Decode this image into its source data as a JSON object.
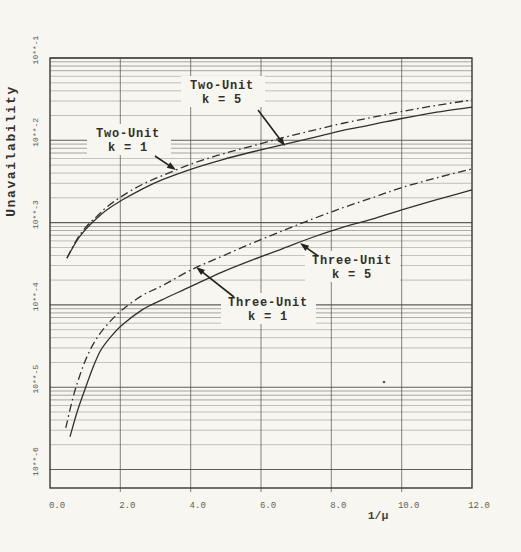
{
  "page": {
    "background": "#f7f6f1",
    "ink_color": "#34312b"
  },
  "chart_data": {
    "type": "line",
    "title": "",
    "xlabel": "1/μ",
    "ylabel": "Unavailability",
    "x_scale": "linear",
    "y_scale": "log",
    "xlim": [
      0,
      12
    ],
    "ylim": [
      1e-06,
      0.1
    ],
    "grid": "horizontal log minor lines each decade (2-9), vertical major lines every 2.0",
    "legend": "none (curves labeled on-plot with arrows)",
    "x_ticks": [
      {
        "label": "0.0",
        "value": 0
      },
      {
        "label": "2.0",
        "value": 2
      },
      {
        "label": "4.0",
        "value": 4
      },
      {
        "label": "6.0",
        "value": 6
      },
      {
        "label": "8.0",
        "value": 8
      },
      {
        "label": "10.0",
        "value": 10
      },
      {
        "label": "12.0",
        "value": 12
      }
    ],
    "y_ticks": [
      {
        "label": "10**-1",
        "value": 0.1
      },
      {
        "label": "10**-2",
        "value": 0.01
      },
      {
        "label": "10**-3",
        "value": 0.001
      },
      {
        "label": "10**-4",
        "value": 0.0001
      },
      {
        "label": "10**-5",
        "value": 1e-05
      },
      {
        "label": "10**-6",
        "value": 1e-06
      }
    ],
    "series": [
      {
        "name": "two-unit-k1",
        "label": "Two-Unit k = 1",
        "line_style": "dashdot",
        "points": [
          [
            0.48,
            0.00037
          ],
          [
            0.77,
            0.00063
          ],
          [
            1.05,
            0.00091
          ],
          [
            1.34,
            0.0012
          ],
          [
            1.62,
            0.00155
          ],
          [
            2.05,
            0.0021
          ],
          [
            2.62,
            0.0029
          ],
          [
            3.18,
            0.0037
          ],
          [
            4.04,
            0.0052
          ],
          [
            4.89,
            0.0068
          ],
          [
            5.74,
            0.0085
          ],
          [
            6.6,
            0.0107
          ],
          [
            7.45,
            0.0131
          ],
          [
            8.3,
            0.016
          ],
          [
            9.16,
            0.019
          ],
          [
            10.0,
            0.0224
          ],
          [
            11.0,
            0.0266
          ],
          [
            12.0,
            0.031
          ]
        ]
      },
      {
        "name": "two-unit-k5",
        "label": "Two-Unit k = 5",
        "line_style": "solid",
        "points": [
          [
            0.48,
            0.00037
          ],
          [
            0.77,
            0.00061
          ],
          [
            1.05,
            0.00086
          ],
          [
            1.34,
            0.00114
          ],
          [
            1.62,
            0.00143
          ],
          [
            2.05,
            0.00188
          ],
          [
            2.62,
            0.00255
          ],
          [
            3.18,
            0.0033
          ],
          [
            4.04,
            0.0045
          ],
          [
            4.89,
            0.0058
          ],
          [
            5.74,
            0.0072
          ],
          [
            6.6,
            0.0088
          ],
          [
            7.45,
            0.0107
          ],
          [
            8.3,
            0.0131
          ],
          [
            9.16,
            0.0155
          ],
          [
            10.0,
            0.0184
          ],
          [
            11.0,
            0.022
          ],
          [
            12.0,
            0.0253
          ]
        ]
      },
      {
        "name": "three-unit-k1",
        "label": "Three-Unit k = 1",
        "line_style": "dashdot",
        "points": [
          [
            0.45,
            3.2e-06
          ],
          [
            0.65,
            7.4e-06
          ],
          [
            0.85,
            1.4e-05
          ],
          [
            1.08,
            2.5e-05
          ],
          [
            1.34,
            4e-05
          ],
          [
            1.65,
            5.9e-05
          ],
          [
            2.05,
            8.7e-05
          ],
          [
            2.62,
            0.00013
          ],
          [
            3.18,
            0.00017
          ],
          [
            4.04,
            0.00027
          ],
          [
            4.89,
            0.00039
          ],
          [
            5.74,
            0.00056
          ],
          [
            6.6,
            0.00079
          ],
          [
            7.45,
            0.0011
          ],
          [
            8.3,
            0.0015
          ],
          [
            9.16,
            0.002
          ],
          [
            10.0,
            0.00266
          ],
          [
            11.0,
            0.0035
          ],
          [
            12.0,
            0.0045
          ]
        ]
      },
      {
        "name": "three-unit-k5",
        "label": "Three-Unit k = 5",
        "line_style": "solid",
        "points": [
          [
            0.57,
            2.5e-06
          ],
          [
            0.77,
            5e-06
          ],
          [
            0.97,
            8.8e-06
          ],
          [
            1.19,
            1.6e-05
          ],
          [
            1.42,
            2.7e-05
          ],
          [
            1.71,
            4e-05
          ],
          [
            2.05,
            5.7e-05
          ],
          [
            2.62,
            8.7e-05
          ],
          [
            3.18,
            0.000115
          ],
          [
            4.04,
            0.00017
          ],
          [
            4.89,
            0.00025
          ],
          [
            5.74,
            0.00035
          ],
          [
            6.6,
            0.00048
          ],
          [
            7.45,
            0.00066
          ],
          [
            8.3,
            0.00087
          ],
          [
            9.16,
            0.0011
          ],
          [
            10.0,
            0.00143
          ],
          [
            11.0,
            0.0019
          ],
          [
            12.0,
            0.0025
          ]
        ]
      }
    ],
    "annotations": [
      {
        "name": "two-unit-k5-label",
        "lines": [
          "Two-Unit",
          "k = 5"
        ],
        "cx": 222,
        "y1": 89,
        "y2": 103,
        "box": {
          "x": 181,
          "y": 76,
          "w": 84,
          "h": 31
        },
        "arrow": {
          "x1": 258,
          "y1": 110,
          "x2": 285,
          "y2": 146
        }
      },
      {
        "name": "two-unit-k1-label",
        "lines": [
          "Two-Unit",
          "k = 1"
        ],
        "cx": 128,
        "y1": 137,
        "y2": 151,
        "box": {
          "x": 87,
          "y": 124,
          "w": 84,
          "h": 31
        },
        "arrow": {
          "x1": 155,
          "y1": 156,
          "x2": 176,
          "y2": 170
        }
      },
      {
        "name": "three-unit-k5-label",
        "lines": [
          "Three-Unit",
          "k = 5"
        ],
        "cx": 352,
        "y1": 264,
        "y2": 278,
        "box": {
          "x": 305,
          "y": 251,
          "w": 95,
          "h": 31
        },
        "arrow": {
          "x1": 318,
          "y1": 256,
          "x2": 300,
          "y2": 243
        }
      },
      {
        "name": "three-unit-k1-label",
        "lines": [
          "Three-Unit",
          "k = 1"
        ],
        "cx": 268,
        "y1": 306,
        "y2": 320,
        "box": {
          "x": 221,
          "y": 293,
          "w": 95,
          "h": 31
        },
        "arrow": {
          "x1": 234,
          "y1": 297,
          "x2": 196,
          "y2": 267
        }
      }
    ],
    "layout": {
      "plot": {
        "left": 50,
        "right": 472,
        "top": 58,
        "bottom": 488
      },
      "decade_px": 82.3,
      "x_tick_label_y": 500,
      "x_tick_label_dx": 7,
      "y_tick_label_x": 38,
      "y_tick_label_dy": -8,
      "xlabel_pos": {
        "x": 378,
        "y": 519
      },
      "ylabel_pos": {
        "x": 15,
        "y": 151
      }
    }
  }
}
